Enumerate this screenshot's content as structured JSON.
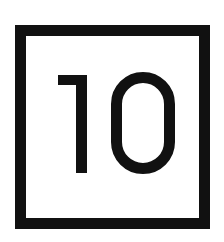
{
  "icon": {
    "name": "number-ten-square-icon",
    "value": "10",
    "border_color": "#111111",
    "text_color": "#111111",
    "background_color": "#ffffff"
  }
}
